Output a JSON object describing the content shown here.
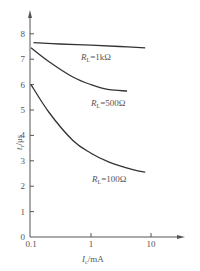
{
  "chart_data": {
    "type": "line",
    "title": "",
    "xlabel": "I_c/mA",
    "ylabel": "t_r/μs",
    "xscale": "log",
    "xlim": [
      0.1,
      20
    ],
    "ylim": [
      0,
      8.5
    ],
    "x_ticks": [
      "0.1",
      "1",
      "10"
    ],
    "y_ticks": [
      "0",
      "1",
      "2",
      "3",
      "4",
      "5",
      "6",
      "7",
      "8"
    ],
    "grid": false,
    "legend": "inline labels",
    "series": [
      {
        "name": "R_L=1kΩ",
        "label_prefix": "R",
        "label_sub": "L",
        "label_suffix": "=1kΩ",
        "x": [
          0.11,
          0.3,
          1,
          3,
          8
        ],
        "y": [
          7.65,
          7.6,
          7.55,
          7.5,
          7.45
        ]
      },
      {
        "name": "R_L=500Ω",
        "label_prefix": "R",
        "label_sub": "L",
        "label_suffix": "=500Ω",
        "x": [
          0.1,
          0.2,
          0.5,
          1,
          2,
          4
        ],
        "y": [
          7.45,
          6.9,
          6.3,
          6.0,
          5.8,
          5.75
        ]
      },
      {
        "name": "R_L=100Ω",
        "label_prefix": "R",
        "label_sub": "L",
        "label_suffix": "=100Ω",
        "x": [
          0.1,
          0.2,
          0.5,
          1,
          2,
          5,
          8
        ],
        "y": [
          6.0,
          4.9,
          3.8,
          3.3,
          2.95,
          2.65,
          2.55
        ]
      }
    ]
  },
  "axes": {
    "y_title_main": "t",
    "y_title_sub": "r",
    "y_title_unit": "/μs",
    "x_title_main": "I",
    "x_title_sub": "c",
    "x_title_unit": "/mA"
  }
}
